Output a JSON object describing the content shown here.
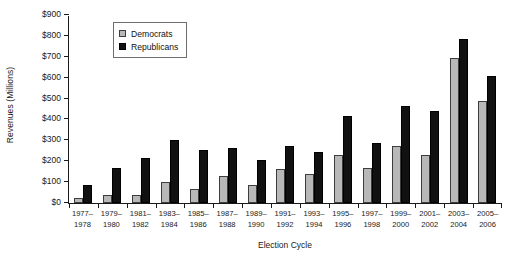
{
  "chart_data": {
    "type": "bar",
    "title": "",
    "xlabel": "Election Cycle",
    "ylabel": "Revenues (Millions)",
    "ylim": [
      0,
      900
    ],
    "ytick_values": [
      0,
      100,
      200,
      300,
      400,
      500,
      600,
      700,
      800,
      900
    ],
    "ytick_labels": [
      "$0",
      "$100",
      "$200",
      "$300",
      "$400",
      "$500",
      "$600",
      "$700",
      "$800",
      "$900"
    ],
    "grid": false,
    "legend_position": "upper left",
    "categories": [
      "1977–\n1978",
      "1979–\n1980",
      "1981–\n1982",
      "1983–\n1984",
      "1985–\n1986",
      "1987–\n1988",
      "1989–\n1990",
      "1991–\n1992",
      "1993–\n1994",
      "1995–\n1996",
      "1997–\n1998",
      "1999–\n2000",
      "2001–\n2002",
      "2003–\n2004",
      "2005–\n2006"
    ],
    "category_lines": [
      [
        "1977–",
        "1978"
      ],
      [
        "1979–",
        "1980"
      ],
      [
        "1981–",
        "1982"
      ],
      [
        "1983–",
        "1984"
      ],
      [
        "1985–",
        "1986"
      ],
      [
        "1987–",
        "1988"
      ],
      [
        "1989–",
        "1990"
      ],
      [
        "1991–",
        "1992"
      ],
      [
        "1993–",
        "1994"
      ],
      [
        "1995–",
        "1996"
      ],
      [
        "1997–",
        "1998"
      ],
      [
        "1999–",
        "2000"
      ],
      [
        "2001–",
        "2002"
      ],
      [
        "2003–",
        "2004"
      ],
      [
        "2005–",
        "2006"
      ]
    ],
    "series": [
      {
        "name": "Democrats",
        "color": "#b8b8b8",
        "values": [
          25,
          37,
          39,
          99,
          65,
          128,
          87,
          164,
          139,
          229,
          166,
          275,
          229,
          694,
          490
        ]
      },
      {
        "name": "Republicans",
        "color": "#111111",
        "values": [
          85,
          169,
          215,
          300,
          256,
          265,
          207,
          273,
          246,
          417,
          285,
          466,
          441,
          785,
          610
        ]
      }
    ]
  },
  "legend": {
    "items": [
      {
        "label": "Democrats",
        "swatch": "dem"
      },
      {
        "label": "Republicans",
        "swatch": "rep"
      }
    ]
  }
}
